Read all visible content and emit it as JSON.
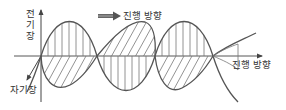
{
  "diagram": {
    "title": "",
    "labels": {
      "electric_field": "전기장",
      "electric_field_chars": [
        "전",
        "기",
        "장"
      ],
      "magnetic_field": "자기장",
      "propagation_top": "진행 방향",
      "propagation_axis": "진행 방향"
    },
    "colors": {
      "line": "#555555",
      "axis": "#444444",
      "hatch": "#777777",
      "text": "#333333",
      "arrow_fill": "#555555"
    },
    "nodes": [
      {
        "id": "electric-wave",
        "label": "전기장",
        "orientation": "vertical"
      },
      {
        "id": "magnetic-wave",
        "label": "자기장",
        "orientation": "horizontal (perspective)"
      },
      {
        "id": "propagation",
        "label": "진행 방향",
        "orientation": "along axis"
      }
    ]
  }
}
